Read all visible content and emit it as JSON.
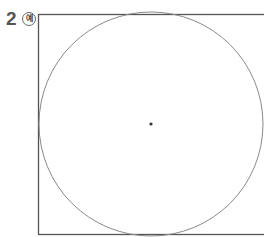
{
  "problem": {
    "number": "2",
    "example_badge": "예"
  },
  "figure": {
    "shape": "square with inscribed circle and center point",
    "square": {
      "x": 38,
      "y": 14,
      "width": 226,
      "height": 221
    },
    "circle": {
      "cx": 151,
      "cy": 124,
      "r": 112
    },
    "center_point": {
      "cx": 151,
      "cy": 124,
      "r": 1.6
    },
    "colors": {
      "square_stroke": "#555555",
      "circle_stroke": "#8a8a8a",
      "point": "#333333"
    }
  }
}
